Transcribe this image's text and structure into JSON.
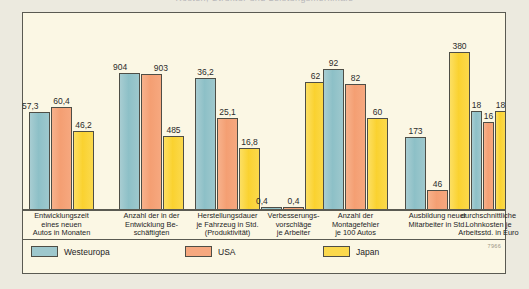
{
  "title": {
    "text": "Kosten, Struktur und Leistungsmerkmale",
    "note": "clipped at top edge of screenshot"
  },
  "source_number": "7966",
  "colors": {
    "westeuropa": "#9ec8cd",
    "usa": "#f6a87f",
    "japan": "#fbd94c",
    "panel_bg": "#fbf7e4",
    "page_bg": "#eceadf",
    "frame": "#5a5a52"
  },
  "legend": {
    "items": [
      {
        "label": "Westeuropa",
        "key": "we"
      },
      {
        "label": "USA",
        "key": "us"
      },
      {
        "label": "Japan",
        "key": "jp"
      }
    ]
  },
  "chart_data": {
    "type": "bar",
    "title": "Kosten, Struktur und Leistungsmerkmale",
    "xlabel": "",
    "ylabel": "",
    "grid": false,
    "legend_position": "bottom",
    "note": "Each category group is scaled independently (no common y-axis); values are printed above each bar.",
    "categories": [
      "Entwicklungszeit eines neuen Autos in Monaten",
      "Anzahl der in der Entwicklung Beschäftigten",
      "Herstellungsdauer je Fahrzeug in Std. (Produktivität)",
      "Verbesserungsvorschläge je Arbeiter",
      "Anzahl der Montagefehler je 100 Autos",
      "Ausbildung neuer Mitarbeiter in Std.",
      "durchschnittliche Lohnkosten je Arbeitsstd. in Euro"
    ],
    "category_lines": [
      [
        "Entwicklungszeit",
        "eines neuen",
        "Autos in Monaten"
      ],
      [
        "Anzahl der in der",
        "Entwicklung Be-",
        "schäftigten"
      ],
      [
        "Herstellungsdauer",
        "je Fahrzeug in Std.",
        "(Produktivität)"
      ],
      [
        "Verbesserungs-",
        "vorschläge",
        "je Arbeiter"
      ],
      [
        "Anzahl der",
        "Montagefehler",
        "je 100 Autos"
      ],
      [
        "Ausbildung neuer",
        "Mitarbeiter in Std."
      ],
      [
        "durchschnittliche",
        "Lohnkosten je",
        "Arbeitsstd. in Euro"
      ]
    ],
    "series": [
      {
        "name": "Westeuropa",
        "key": "we",
        "values": [
          57.3,
          904,
          36.2,
          0.4,
          92,
          173,
          18
        ]
      },
      {
        "name": "USA",
        "key": "us",
        "values": [
          60.4,
          903,
          25.1,
          0.4,
          82,
          46,
          16
        ]
      },
      {
        "name": "Japan",
        "key": "jp",
        "values": [
          46.2,
          485,
          16.8,
          62,
          60,
          380,
          18
        ]
      }
    ],
    "value_labels": [
      {
        "category": 0,
        "labels": [
          "57,3",
          "60,4",
          "46,2"
        ]
      },
      {
        "category": 1,
        "labels": [
          "904",
          "903",
          "485"
        ]
      },
      {
        "category": 2,
        "labels": [
          "36,2",
          "25,1",
          "16,8"
        ]
      },
      {
        "category": 3,
        "labels": [
          "0,4",
          "0,4",
          "62"
        ]
      },
      {
        "category": 4,
        "labels": [
          "92",
          "82",
          "60"
        ]
      },
      {
        "category": 5,
        "labels": [
          "173",
          "46",
          "380"
        ]
      },
      {
        "category": 6,
        "labels": [
          "18",
          "16",
          "18"
        ]
      }
    ]
  }
}
